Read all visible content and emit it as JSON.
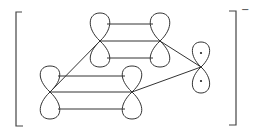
{
  "diagram": {
    "charge": "−",
    "orbitals": [
      {
        "id": "top-left",
        "cx": 100,
        "cy": 41
      },
      {
        "id": "top-right",
        "cx": 160,
        "cy": 41
      },
      {
        "id": "bottom-left",
        "cx": 50,
        "cy": 92
      },
      {
        "id": "bottom-right",
        "cx": 132,
        "cy": 92
      },
      {
        "id": "right-anion",
        "cx": 201,
        "cy": 67,
        "electrons": 2
      }
    ]
  }
}
